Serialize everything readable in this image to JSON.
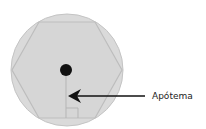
{
  "diagram": {
    "title": "",
    "shapes": {
      "circle": {
        "role": "circumscribed-circle"
      },
      "hexagon": {
        "role": "inscribed-regular-hexagon",
        "sides": 6
      },
      "center_point": {
        "role": "center"
      },
      "apothem_segment": {
        "role": "apothem"
      },
      "right_angle_marker": {
        "role": "right-angle"
      }
    },
    "annotation": {
      "label": "Apótema",
      "points_to": "apothem_segment"
    },
    "colors": {
      "fill": "#dadada",
      "stroke": "#bdbdbd",
      "ink": "#111111",
      "text": "#222222"
    }
  }
}
